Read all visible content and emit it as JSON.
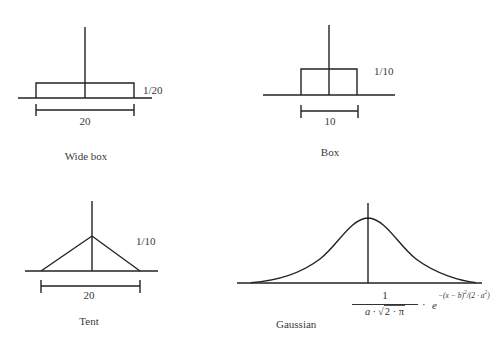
{
  "panels": [
    {
      "id": "wide-box",
      "title": "Wide box",
      "height_label": "1/20",
      "width_label": "20",
      "shape": "box"
    },
    {
      "id": "box",
      "title": "Box",
      "height_label": "1/10",
      "width_label": "10",
      "shape": "box"
    },
    {
      "id": "tent",
      "title": "Tent",
      "height_label": "1/10",
      "width_label": "20",
      "shape": "triangle"
    },
    {
      "id": "gaussian",
      "title": "Gaussian",
      "shape": "bell-curve",
      "formula": {
        "numerator": "1",
        "denominator_prefix": "a · ",
        "denominator_sqrt": "2 · π",
        "multiply": "·",
        "base": "e",
        "exponent": "−(x − b)",
        "exponent_sq1": "2",
        "exponent_mid": "/(2 · a",
        "exponent_sq2": "2",
        "exponent_end": ")"
      }
    }
  ],
  "colors": {
    "stroke": "#222222",
    "text": "#3a3a3a",
    "background": "#ffffff"
  }
}
